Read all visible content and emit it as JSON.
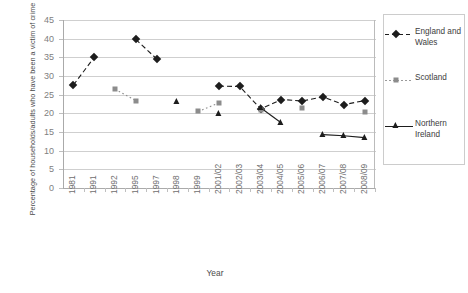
{
  "chart_data": {
    "type": "line",
    "title": "",
    "xlabel": "Year",
    "ylabel": "Percentage of households/adults who have been a victim of crime",
    "ylim": [
      0,
      45
    ],
    "ytick_step": 5,
    "yticks": [
      "45",
      "40",
      "35",
      "30",
      "25",
      "20",
      "15",
      "10",
      "5",
      "0"
    ],
    "grid": true,
    "legend_position": "right",
    "categories": [
      "1981",
      "1991",
      "1992",
      "1995",
      "1997",
      "1998",
      "1999",
      "2001/02",
      "2002/03",
      "2003/04",
      "2004/05",
      "2005/06",
      "2006/07",
      "2007/08",
      "2008/09"
    ],
    "series": [
      {
        "name": "England and Wales",
        "marker": "diamond",
        "linestyle": "dashed",
        "color": "#1d1d1d",
        "values": [
          27.6,
          35.0,
          null,
          39.8,
          34.6,
          null,
          null,
          27.3,
          27.2,
          21.2,
          23.7,
          23.3,
          24.4,
          22.3,
          23.4
        ]
      },
      {
        "name": "Scotland",
        "marker": "square",
        "linestyle": "dotted",
        "color": "#8c8c8c",
        "values": [
          null,
          null,
          26.5,
          23.4,
          null,
          null,
          20.5,
          22.8,
          null,
          21.0,
          null,
          21.3,
          null,
          null,
          20.4
        ]
      },
      {
        "name": "Northern Ireland",
        "marker": "triangle",
        "linestyle": "solid",
        "color": "#1d1d1d",
        "values": [
          null,
          null,
          null,
          null,
          null,
          23.0,
          null,
          19.8,
          null,
          21.5,
          17.4,
          null,
          14.3,
          14.0,
          13.5
        ]
      }
    ]
  },
  "legend": {
    "items": [
      {
        "label": "England and Wales"
      },
      {
        "label": "Scotland"
      },
      {
        "label": "Northern Ireland"
      }
    ]
  }
}
